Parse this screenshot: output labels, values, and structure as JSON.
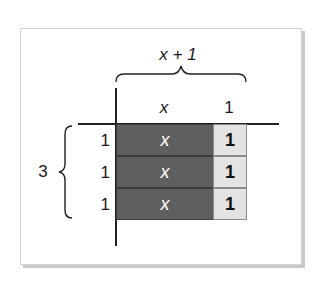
{
  "diagram": {
    "top_expression": "x + 1",
    "column_labels": [
      "x",
      "1"
    ],
    "side_label": "3",
    "rows": [
      {
        "row_label": "1",
        "tiles": [
          "x",
          "1"
        ]
      },
      {
        "row_label": "1",
        "tiles": [
          "x",
          "1"
        ]
      },
      {
        "row_label": "1",
        "tiles": [
          "x",
          "1"
        ]
      }
    ],
    "colors": {
      "x_tile": "#5f5f5f",
      "unit_tile": "#e3e3e3",
      "frame_border": "#d4d4d4",
      "frame_shadow": "#c8c8c8"
    }
  }
}
